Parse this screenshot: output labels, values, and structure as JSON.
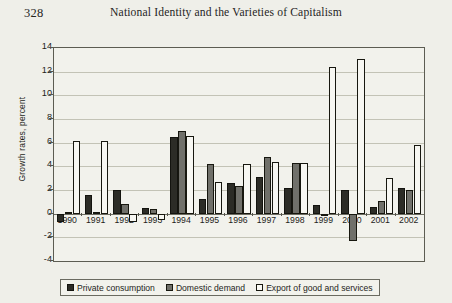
{
  "page": {
    "folio": "328",
    "running_head": "National Identity and the Varieties of Capitalism"
  },
  "chart_data": {
    "type": "bar",
    "title": "",
    "xlabel": "",
    "ylabel": "Growth rates, percent",
    "ylim": [
      -4,
      14
    ],
    "yticks": [
      -4,
      -2,
      0,
      2,
      4,
      6,
      8,
      10,
      12,
      14
    ],
    "grid": true,
    "legend_position": "bottom",
    "categories": [
      "1990",
      "1991",
      "1992",
      "1993",
      "1994",
      "1995",
      "1996",
      "1997",
      "1998",
      "1999",
      "2000",
      "2001",
      "2002"
    ],
    "series": [
      {
        "name": "Private consumption",
        "color": "#2c2c26",
        "values": [
          -0.7,
          1.6,
          2.0,
          0.5,
          6.5,
          1.2,
          2.6,
          3.1,
          2.2,
          0.7,
          2.0,
          0.6,
          2.2
        ]
      },
      {
        "name": "Domestic demand",
        "color": "#70706a",
        "values": [
          0.1,
          0.1,
          0.8,
          0.4,
          7.0,
          4.2,
          2.3,
          4.8,
          4.3,
          0.0,
          -2.3,
          1.1,
          2.0
        ]
      },
      {
        "name": "Export of good and services",
        "color": "#f7f7f2",
        "values": [
          6.1,
          6.1,
          -0.7,
          -0.5,
          6.6,
          2.7,
          4.2,
          4.4,
          4.3,
          12.4,
          13.1,
          3.0,
          5.8
        ]
      }
    ]
  }
}
